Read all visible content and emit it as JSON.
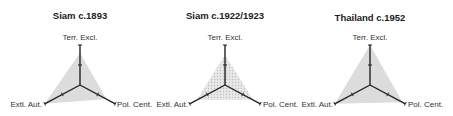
{
  "chart_data": [
    {
      "type": "radar",
      "title": "Siam c.1893",
      "axes": [
        "Terr. Excl.",
        "Pol. Cent.",
        "Extl. Aut."
      ],
      "values": [
        0.8,
        0.75,
        1.0
      ],
      "range": [
        0,
        1
      ],
      "tick_marks": [
        0.5,
        1.0
      ],
      "fill": "solid-gray",
      "center": [
        80,
        85
      ],
      "axis_length": 40
    },
    {
      "type": "radar",
      "title": "Siam c.1922/1923",
      "axes": [
        "Terr. Excl.",
        "Pol. Cent.",
        "Extl. Aut."
      ],
      "values": [
        0.75,
        0.8,
        0.8
      ],
      "range": [
        0,
        1
      ],
      "tick_marks": [
        0.5,
        1.0
      ],
      "fill": "dotted-gray",
      "center": [
        225,
        85
      ],
      "axis_length": 40
    },
    {
      "type": "radar",
      "title": "Thailand c.1952",
      "axes": [
        "Terr. Excl.",
        "Pol. Cent.",
        "Extl. Aut."
      ],
      "values": [
        1.0,
        0.92,
        1.0
      ],
      "range": [
        0,
        1
      ],
      "tick_marks": [
        0.5,
        1.0
      ],
      "fill": "solid-gray",
      "center": [
        370,
        85
      ],
      "axis_length": 40
    }
  ],
  "colors": {
    "axis": "#222222",
    "fill": "#dcdcdc",
    "dot_fill": "#e6e6e6",
    "dot": "#bdbdbd"
  }
}
